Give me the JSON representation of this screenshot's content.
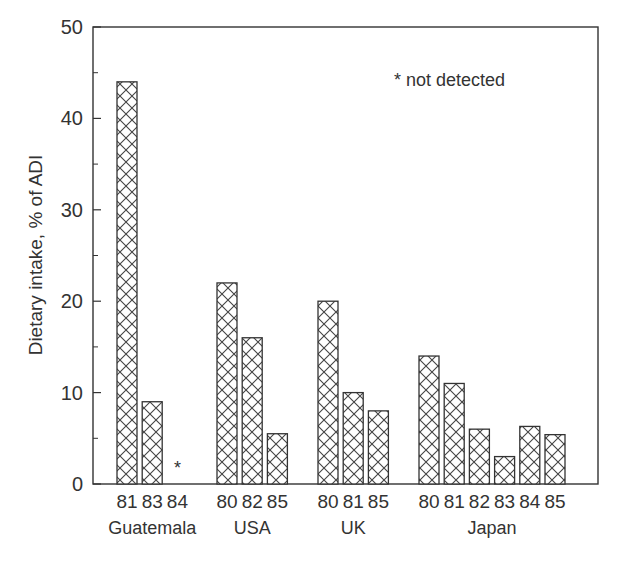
{
  "chart_data": {
    "type": "bar",
    "title": "",
    "xlabel": "",
    "ylabel": "Dietary intake, % of ADI",
    "ylim": [
      0,
      50
    ],
    "yticks": [
      0,
      10,
      20,
      30,
      40,
      50
    ],
    "minor_yticks": [
      5,
      15,
      25,
      35,
      45
    ],
    "grid": false,
    "frame": "box",
    "pattern": "crosshatch",
    "annotation": "* not detected",
    "groups": [
      {
        "name": "Guatemala",
        "categories": [
          "81",
          "83",
          "84"
        ],
        "values": [
          44,
          9,
          null
        ],
        "markers": [
          "",
          "",
          "*"
        ]
      },
      {
        "name": "USA",
        "categories": [
          "80",
          "82",
          "85"
        ],
        "values": [
          22,
          16,
          5.5
        ],
        "markers": [
          "",
          "",
          ""
        ]
      },
      {
        "name": "UK",
        "categories": [
          "80",
          "81",
          "85"
        ],
        "values": [
          20,
          10,
          8
        ],
        "markers": [
          "",
          "",
          ""
        ]
      },
      {
        "name": "Japan",
        "categories": [
          "80",
          "81",
          "82",
          "83",
          "84",
          "85"
        ],
        "values": [
          14,
          11,
          6,
          3,
          6.3,
          5.4
        ],
        "markers": [
          "",
          "",
          "",
          "",
          "",
          ""
        ]
      }
    ]
  },
  "chart": {
    "ylabel": "Dietary intake, % of ADI",
    "note": "* not detected",
    "not_detected_marker": "*"
  }
}
